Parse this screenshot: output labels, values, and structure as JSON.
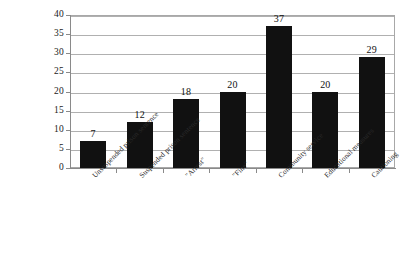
{
  "chart_data": {
    "type": "bar",
    "title": "",
    "subtitle": "",
    "xlabel": "",
    "ylabel": "",
    "categories": [
      "Unsuspended prison sentence",
      "Suspended prison sentence",
      "\"Arrest\"",
      "\"Fine\"",
      "Community service",
      "Educational measures",
      "Cautioning"
    ],
    "values": [
      7,
      12,
      18,
      20,
      37,
      20,
      29
    ],
    "data_labels": [
      "7",
      "12",
      "18",
      "20",
      "37",
      "20",
      "29"
    ],
    "ylim": [
      0,
      40
    ],
    "ytick_step": 5,
    "ytick_labels": [
      "40",
      "35",
      "30",
      "25",
      "20",
      "15",
      "10",
      "5",
      "0"
    ],
    "ytick_values": [
      40,
      35,
      30,
      25,
      20,
      15,
      10,
      5,
      0
    ],
    "grid": true,
    "grid_axis": "y",
    "legend": false,
    "legend_position": "none",
    "colors": {
      "bar": "#111111",
      "gridline": "#b0b0b0",
      "axis": "#8a8a8a",
      "plot_border": "#a8a8a8",
      "text": "#1a1a1a",
      "background": "#ffffff"
    }
  }
}
